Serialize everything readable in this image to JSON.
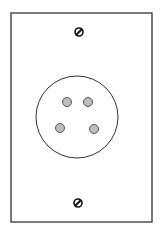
{
  "figure": {
    "background": "#ffffff",
    "stroke_color": "#333333",
    "pin_fill": "#bdbdbd",
    "plate": {
      "x": 11,
      "y": 13,
      "width": 141,
      "height": 209
    },
    "socket": {
      "cx": 77,
      "cy": 117,
      "r": 41
    },
    "pins": [
      {
        "cx": 67,
        "cy": 102,
        "r": 4.5
      },
      {
        "cx": 88,
        "cy": 102,
        "r": 4.5
      },
      {
        "cx": 60,
        "cy": 128,
        "r": 4.5
      },
      {
        "cx": 94,
        "cy": 129,
        "r": 4.5
      }
    ],
    "screws": [
      {
        "cx": 79,
        "cy": 32,
        "r": 4
      },
      {
        "cx": 78,
        "cy": 203,
        "r": 4
      }
    ]
  }
}
